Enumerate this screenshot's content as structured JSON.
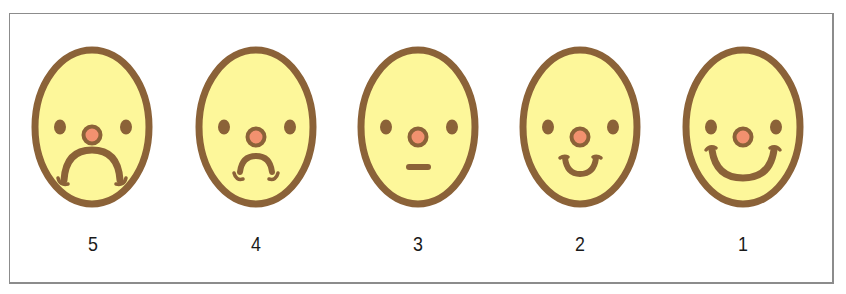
{
  "colors": {
    "face_fill": "#fdf79a",
    "outline": "#8b6238",
    "nose_fill": "#f2916f",
    "frame": "#8c8c8c"
  },
  "faces": [
    {
      "label": "5",
      "expression": "very-sad",
      "cx": 92
    },
    {
      "label": "4",
      "expression": "sad",
      "cx": 256
    },
    {
      "label": "3",
      "expression": "neutral",
      "cx": 418
    },
    {
      "label": "2",
      "expression": "happy",
      "cx": 580
    },
    {
      "label": "1",
      "expression": "very-happy",
      "cx": 743
    }
  ]
}
